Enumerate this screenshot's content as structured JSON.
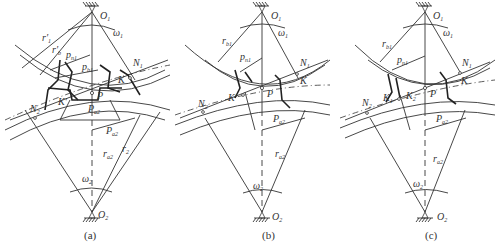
{
  "figure": {
    "panels": [
      {
        "id": "a",
        "caption": "(a)",
        "labels": {
          "O1": "O",
          "O1_sub": "1",
          "O2": "O",
          "O2_sub": "2",
          "w1": "ω",
          "w1_sub": "1",
          "w2": "ω",
          "w2_sub": "2",
          "r1p": "r′",
          "r1p_sub": "1",
          "rb1p": "r′",
          "rb1p_sub": "b",
          "pn1a": "p",
          "pn1a_sub": "n1",
          "pb1": "p",
          "pb1_sub": "b1",
          "N1": "N",
          "N1_sub": "1",
          "N2": "N",
          "N2_sub": "2",
          "K": "K",
          "Kp": "K′",
          "P": "P",
          "pa2a": "P",
          "pa2a_sub": "a2",
          "pa2b": "P",
          "pa2b_sub": "a2",
          "ra2": "r",
          "ra2_sub": "a2",
          "r2": "r",
          "r2_sub": "2"
        }
      },
      {
        "id": "b",
        "caption": "(b)",
        "labels": {
          "O1": "O",
          "O1_sub": "1",
          "O2": "O",
          "O2_sub": "2",
          "w1": "ω",
          "w1_sub": "1",
          "w2": "ω",
          "w2_sub": "2",
          "rb1": "r",
          "rb1_sub": "b1",
          "pn1": "p",
          "pn1_sub": "n1",
          "N1": "N",
          "N1_sub": "1",
          "N2": "N",
          "N2_sub": "2",
          "K": "K",
          "Kp": "K′",
          "P": "P",
          "pa2": "P",
          "pa2_sub": "a2",
          "ra2": "r",
          "ra2_sub": "a2"
        }
      },
      {
        "id": "c",
        "caption": "(c)",
        "labels": {
          "O1": "O",
          "O1_sub": "1",
          "O2": "O",
          "O2_sub": "2",
          "w1": "ω",
          "w1_sub": "1",
          "w2": "ω",
          "w2_sub": "2",
          "rb1": "r",
          "rb1_sub": "b1",
          "pn1": "p",
          "pn1_sub": "n1",
          "N1": "N",
          "N1_sub": "1",
          "N2": "N",
          "N2_sub": "2",
          "K": "K",
          "K1": "K",
          "K1_sub": "1",
          "K2": "K",
          "K2_sub": "2",
          "P": "P",
          "pa2": "P",
          "pa2_sub": "a2",
          "ra2": "r",
          "ra2_sub": "a2"
        }
      }
    ]
  }
}
